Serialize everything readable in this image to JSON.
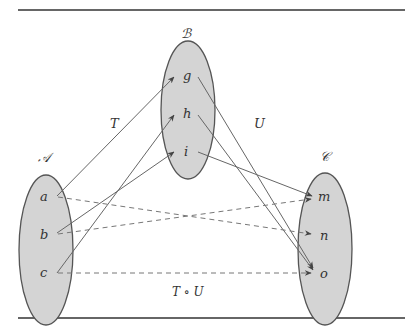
{
  "sets": [
    {
      "name": "A",
      "label": "𝒜",
      "elements": [
        "a",
        "b",
        "c"
      ]
    },
    {
      "name": "B",
      "label": "ℬ",
      "elements": [
        "g",
        "h",
        "i"
      ]
    },
    {
      "name": "C",
      "label": "𝒞",
      "elements": [
        "m",
        "n",
        "o"
      ]
    }
  ],
  "mappings": {
    "T": {
      "label": "T",
      "pairs": [
        [
          "a",
          "g"
        ],
        [
          "b",
          "i"
        ],
        [
          "c",
          "h"
        ]
      ]
    },
    "U": {
      "label": "U",
      "pairs": [
        [
          "g",
          "n"
        ],
        [
          "h",
          "o"
        ],
        [
          "i",
          "m"
        ]
      ]
    },
    "TU": {
      "label": "T ∘ U",
      "pairs": [
        [
          "a",
          "n"
        ],
        [
          "b",
          "m"
        ],
        [
          "c",
          "o"
        ]
      ]
    }
  },
  "colors": {
    "fill": "#d4d4d4",
    "stroke": "#555555",
    "line": "#666666",
    "rule": "#333333"
  }
}
